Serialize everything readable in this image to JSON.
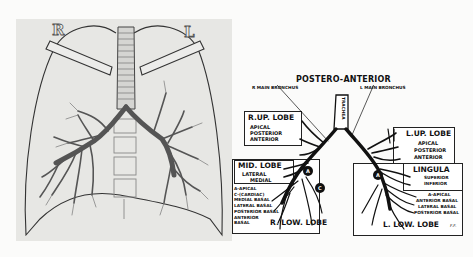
{
  "xray": {
    "label_right": "R",
    "label_left": "L"
  },
  "schematic": {
    "title": "POSTERO-ANTERIOR",
    "r_main_bronchus": "R MAIN BRONCHUS",
    "l_main_bronchus": "L MAIN BRONCHUS",
    "trachea": "TRACHEA",
    "r_up_lobe": {
      "heading": "R.UP. LOBE",
      "segments": [
        "APICAL",
        "POSTERIOR",
        "ANTERIOR"
      ]
    },
    "mid_lobe": {
      "heading": "MID. LOBE",
      "segments": [
        "LATERAL",
        "MEDIAL"
      ]
    },
    "r_low_lobe": {
      "heading": "R. LOW. LOBE",
      "segments": [
        "A-APICAL",
        "C-(CARDIAC)",
        "MEDIAL BASAL",
        "LATERAL BASAL",
        "POSTERIOR BASAL",
        "ANTERIOR",
        "BASAL"
      ]
    },
    "l_up_lobe": {
      "heading": "L.UP. LOBE",
      "segments": [
        "APICAL",
        "POSTERIOR",
        "ANTERIOR"
      ]
    },
    "lingula": {
      "heading": "LINGULA",
      "segments": [
        "SUPERIOR",
        "INFERIOR"
      ]
    },
    "l_low_lobe": {
      "heading": "L. LOW. LOBE",
      "segments": [
        "A-APICAL",
        "ANTERIOR BASAL",
        "LATERAL BASAL",
        "POSTERIOR BASAL"
      ]
    },
    "marker_a": "A",
    "marker_c": "C",
    "signature": "F.F."
  }
}
